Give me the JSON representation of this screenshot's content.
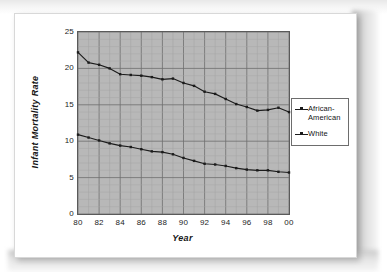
{
  "chart_data": {
    "type": "line",
    "title": "",
    "xlabel": "Year",
    "ylabel": "Infant Mortality Rate",
    "xlim": [
      1980,
      2000
    ],
    "ylim": [
      0,
      25
    ],
    "grid": true,
    "legend_position": "right",
    "x": [
      1980,
      1981,
      1982,
      1983,
      1984,
      1985,
      1986,
      1987,
      1988,
      1989,
      1990,
      1991,
      1992,
      1993,
      1994,
      1995,
      1996,
      1997,
      1998,
      1999,
      2000
    ],
    "xticklabels": [
      "80",
      "82",
      "84",
      "86",
      "88",
      "90",
      "92",
      "94",
      "96",
      "98",
      "00"
    ],
    "xtickvalues": [
      1980,
      1982,
      1984,
      1986,
      1988,
      1990,
      1992,
      1994,
      1996,
      1998,
      2000
    ],
    "yticklabels": [
      "0",
      "5",
      "10",
      "15",
      "20",
      "25"
    ],
    "ytickvalues": [
      0,
      5,
      10,
      15,
      20,
      25
    ],
    "series": [
      {
        "name": "African-American",
        "marker": "square",
        "color": "#1b1b1b",
        "values": [
          22.2,
          20.8,
          20.5,
          20.0,
          19.2,
          19.1,
          19.0,
          18.8,
          18.5,
          18.6,
          18.0,
          17.6,
          16.8,
          16.5,
          15.8,
          15.1,
          14.7,
          14.2,
          14.3,
          14.6,
          14.0
        ]
      },
      {
        "name": "White",
        "marker": "square",
        "color": "#1b1b1b",
        "values": [
          10.9,
          10.5,
          10.1,
          9.7,
          9.4,
          9.2,
          8.9,
          8.6,
          8.5,
          8.2,
          7.7,
          7.3,
          6.9,
          6.8,
          6.6,
          6.3,
          6.1,
          6.0,
          6.0,
          5.8,
          5.7
        ]
      }
    ]
  },
  "legend": {
    "entries": [
      {
        "label_line1": "African-",
        "label_line2": "American"
      },
      {
        "label_line1": "White",
        "label_line2": ""
      }
    ]
  }
}
